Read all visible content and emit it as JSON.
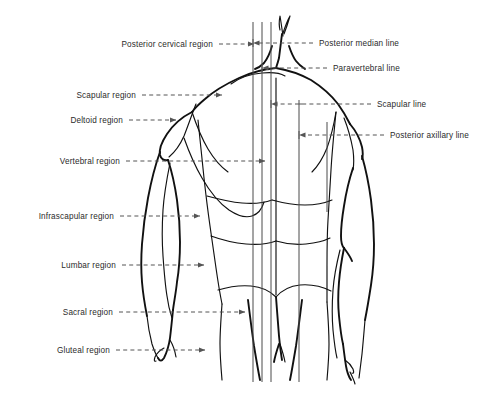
{
  "figure": {
    "kind": "anatomical-diagram",
    "background_color": "#ffffff",
    "outline_color": "#111111",
    "leader_color": "#555555",
    "reference_line_color": "#4a4a4a",
    "width": 490,
    "height": 400
  },
  "labels_left": [
    {
      "id": "posterior-cervical-region",
      "text": "Posterior cervical region",
      "text_x": 213,
      "text_y": 47,
      "leader_from_x": 219,
      "leader_to_x": 254,
      "arrow": true
    },
    {
      "id": "scapular-region",
      "text": "Scapular region",
      "text_x": 136,
      "text_y": 98,
      "leader_from_x": 142,
      "leader_to_x": 222,
      "arrow": true
    },
    {
      "id": "deltoid-region",
      "text": "Deltoid region",
      "text_x": 123,
      "text_y": 123,
      "leader_from_x": 129,
      "leader_to_x": 176,
      "arrow": true
    },
    {
      "id": "vertebral-region",
      "text": "Vertebral region",
      "text_x": 120,
      "text_y": 164,
      "leader_from_x": 126,
      "leader_to_x": 265,
      "arrow": true
    },
    {
      "id": "infrascapular-region",
      "text": "Infrascapular region",
      "text_x": 114,
      "text_y": 219,
      "leader_from_x": 120,
      "leader_to_x": 200,
      "arrow": true
    },
    {
      "id": "lumbar-region",
      "text": "Lumbar region",
      "text_x": 116,
      "text_y": 268,
      "leader_from_x": 122,
      "leader_to_x": 204,
      "arrow": true
    },
    {
      "id": "sacral-region",
      "text": "Sacral region",
      "text_x": 113,
      "text_y": 315,
      "leader_from_x": 119,
      "leader_to_x": 245,
      "arrow": true
    },
    {
      "id": "gluteal-region",
      "text": "Gluteal region",
      "text_x": 110,
      "text_y": 353,
      "leader_from_x": 116,
      "leader_to_x": 205,
      "arrow": true
    }
  ],
  "labels_right": [
    {
      "id": "posterior-median-line",
      "text": "Posterior median line",
      "text_x": 319,
      "text_y": 46,
      "leader_from_x": 313,
      "leader_to_x": 262,
      "ref_x": 262,
      "arrow": false
    },
    {
      "id": "paravertebral-line",
      "text": "Paravertebral line",
      "text_x": 333,
      "text_y": 71,
      "leader_from_x": 327,
      "leader_to_x": 271,
      "ref_x": 271,
      "arrow": false
    },
    {
      "id": "scapular-line",
      "text": "Scapular line",
      "text_x": 377,
      "text_y": 107,
      "leader_from_x": 371,
      "leader_to_x": 299,
      "ref_x": 299,
      "arrow": false
    },
    {
      "id": "posterior-axillary-line",
      "text": "Posterior axillary line",
      "text_x": 390,
      "text_y": 138,
      "leader_from_x": 384,
      "leader_to_x": 327,
      "ref_x": 327,
      "arrow": false
    }
  ],
  "reference_lines": [
    {
      "id": "posterior-median-line-left",
      "x": 253,
      "y_top": 22,
      "y_bottom": 382
    },
    {
      "id": "posterior-median-line-right",
      "x": 262,
      "y_top": 22,
      "y_bottom": 382
    },
    {
      "id": "paravertebral-line",
      "x": 271,
      "y_top": 22,
      "y_bottom": 382
    },
    {
      "id": "scapular-line",
      "x": 299,
      "y_top": 100,
      "y_bottom": 382
    },
    {
      "id": "posterior-axillary-line",
      "x": 327,
      "y_top": 122,
      "y_bottom": 212
    }
  ],
  "regions_listed": [
    "Posterior cervical region",
    "Scapular region",
    "Deltoid region",
    "Vertebral region",
    "Infrascapular region",
    "Lumbar region",
    "Sacral region",
    "Gluteal region"
  ],
  "lines_listed": [
    "Posterior median line",
    "Paravertebral line",
    "Scapular line",
    "Posterior axillary line"
  ]
}
